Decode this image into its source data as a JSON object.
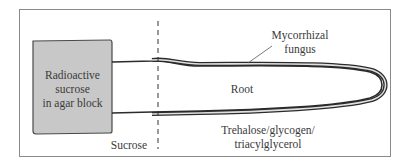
{
  "diagram": {
    "labels": {
      "agar_block": [
        "Radioactive",
        "sucrose",
        "in agar block"
      ],
      "fungus": [
        "Mycorrhizal",
        "fungus"
      ],
      "root": "Root",
      "sucrose": "Sucrose",
      "products": [
        "Trehalose/glycogen/",
        "triacylglycerol"
      ]
    },
    "colors": {
      "frame": "#8a8a8a",
      "agar_fill": "#c8c8c8",
      "agar_stroke": "#4a4a4a",
      "root_stroke": "#2b2b2b",
      "fungus_fill": "#d8d8d8",
      "text": "#3a3a3a"
    }
  }
}
